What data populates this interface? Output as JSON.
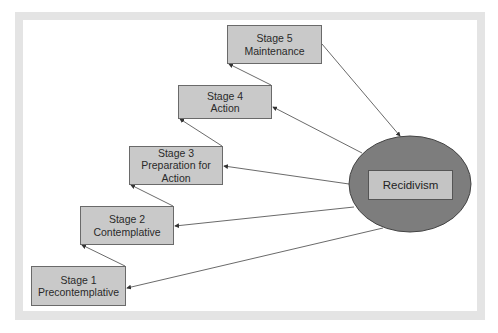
{
  "diagram": {
    "type": "staged-flow",
    "stages": [
      {
        "id": 1,
        "title": "Stage 1",
        "name": "Precontemplative"
      },
      {
        "id": 2,
        "title": "Stage 2",
        "name": "Contemplative"
      },
      {
        "id": 3,
        "title": "Stage 3",
        "name": "Preparation for Action"
      },
      {
        "id": 4,
        "title": "Stage 4",
        "name": "Action"
      },
      {
        "id": 5,
        "title": "Stage 5",
        "name": "Maintenance"
      }
    ],
    "hub": {
      "label": "Recidivism"
    },
    "edges": [
      {
        "from": "Stage 1",
        "to": "Stage 2"
      },
      {
        "from": "Stage 2",
        "to": "Stage 3"
      },
      {
        "from": "Stage 3",
        "to": "Stage 4"
      },
      {
        "from": "Stage 4",
        "to": "Stage 5"
      },
      {
        "from": "Stage 5",
        "to": "Recidivism"
      },
      {
        "from": "Recidivism",
        "to": "Stage 1"
      },
      {
        "from": "Recidivism",
        "to": "Stage 2"
      },
      {
        "from": "Recidivism",
        "to": "Stage 3"
      },
      {
        "from": "Recidivism",
        "to": "Stage 4"
      }
    ]
  },
  "labels": {
    "s1_title": "Stage 1",
    "s1_name": "Precontemplative",
    "s2_title": "Stage 2",
    "s2_name": "Contemplative",
    "s3_title": "Stage 3",
    "s3_name_a": "Preparation for",
    "s3_name_b": "Action",
    "s4_title": "Stage 4",
    "s4_name": "Action",
    "s5_title": "Stage 5",
    "s5_name": "Maintenance",
    "hub": "Recidivism"
  },
  "colors": {
    "box_fill": "#c9c9c9",
    "ellipse_fill": "#7d7d7d",
    "frame": "#e4e4e4"
  }
}
